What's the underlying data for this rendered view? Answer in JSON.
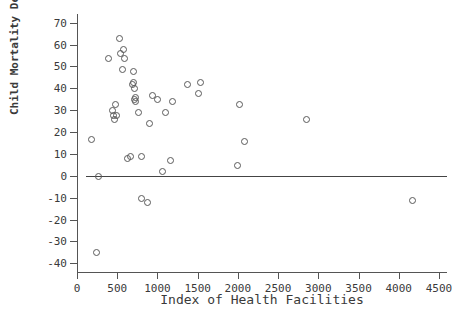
{
  "chart_data": {
    "type": "scatter",
    "title": "",
    "xlabel": "Index of Health Facilities",
    "ylabel": "Child Mortality Decline: %",
    "xlim": [
      0,
      4600
    ],
    "ylim": [
      -44,
      74
    ],
    "xticks": [
      0,
      500,
      1000,
      1500,
      2000,
      2500,
      3000,
      3500,
      4000,
      4500
    ],
    "xticklabels": [
      "0",
      "500",
      "1000",
      "1500",
      "2000",
      "2500",
      "3000",
      "3500",
      "4000",
      "4500"
    ],
    "yticks": [
      -40,
      -30,
      -20,
      -10,
      0,
      10,
      20,
      30,
      40,
      50,
      60,
      70
    ],
    "yticklabels": [
      "-40",
      "-30",
      "-20",
      "-10",
      "0",
      "10",
      "20",
      "30",
      "40",
      "50",
      "60",
      "70"
    ],
    "grid": false,
    "legend": null,
    "marker": "open-circle",
    "marker_color": "#5a5a5a",
    "reference_line": {
      "orientation": "horizontal",
      "y": 0,
      "x_start": 110,
      "x_end": 4600,
      "color": "#444444"
    },
    "points": [
      {
        "x": 180,
        "y": 17
      },
      {
        "x": 240,
        "y": -35
      },
      {
        "x": 255,
        "y": 0
      },
      {
        "x": 380,
        "y": 54
      },
      {
        "x": 430,
        "y": 30
      },
      {
        "x": 445,
        "y": 28
      },
      {
        "x": 460,
        "y": 26
      },
      {
        "x": 470,
        "y": 33
      },
      {
        "x": 480,
        "y": 28
      },
      {
        "x": 520,
        "y": 63
      },
      {
        "x": 540,
        "y": 56
      },
      {
        "x": 560,
        "y": 49
      },
      {
        "x": 575,
        "y": 58
      },
      {
        "x": 590,
        "y": 54
      },
      {
        "x": 620,
        "y": 8
      },
      {
        "x": 655,
        "y": 9
      },
      {
        "x": 680,
        "y": 42
      },
      {
        "x": 690,
        "y": 43
      },
      {
        "x": 700,
        "y": 48
      },
      {
        "x": 705,
        "y": 40
      },
      {
        "x": 710,
        "y": 35
      },
      {
        "x": 715,
        "y": 34
      },
      {
        "x": 720,
        "y": 36
      },
      {
        "x": 760,
        "y": 29
      },
      {
        "x": 790,
        "y": 9
      },
      {
        "x": 800,
        "y": -10
      },
      {
        "x": 870,
        "y": -12
      },
      {
        "x": 900,
        "y": 24
      },
      {
        "x": 930,
        "y": 37
      },
      {
        "x": 1000,
        "y": 35
      },
      {
        "x": 1060,
        "y": 2
      },
      {
        "x": 1100,
        "y": 29
      },
      {
        "x": 1150,
        "y": 7
      },
      {
        "x": 1180,
        "y": 34
      },
      {
        "x": 1370,
        "y": 42
      },
      {
        "x": 1500,
        "y": 38
      },
      {
        "x": 1530,
        "y": 43
      },
      {
        "x": 1990,
        "y": 5
      },
      {
        "x": 2010,
        "y": 33
      },
      {
        "x": 2080,
        "y": 16
      },
      {
        "x": 2850,
        "y": 26
      },
      {
        "x": 4160,
        "y": -11
      }
    ]
  }
}
